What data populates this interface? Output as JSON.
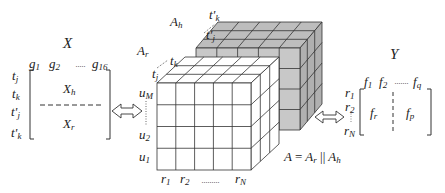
{
  "matrix_x": {
    "title": "X",
    "columns": [
      {
        "base": "g",
        "sub": "1"
      },
      {
        "base": "g",
        "sub": "2"
      },
      {
        "ellipsis": "·····"
      },
      {
        "base": "g",
        "sub": "16"
      }
    ],
    "rows": [
      {
        "base": "t",
        "sub": "j",
        "prime": false
      },
      {
        "base": "t",
        "sub": "k",
        "prime": false
      },
      {
        "base": "t'",
        "sub": "j",
        "prime": true
      },
      {
        "base": "t'",
        "sub": "k",
        "prime": true
      }
    ],
    "blocks": [
      {
        "base": "X",
        "sub": "h"
      },
      {
        "base": "X",
        "sub": "r"
      }
    ]
  },
  "tensor_a": {
    "front_block": {
      "base": "A",
      "sub": "r",
      "depth_labels": [
        {
          "base": "t",
          "sub": "j"
        },
        {
          "base": "t",
          "sub": "k"
        }
      ]
    },
    "back_block": {
      "base": "A",
      "sub": "h",
      "depth_labels": [
        {
          "base": "t'",
          "sub": "j"
        },
        {
          "base": "t'",
          "sub": "k"
        }
      ]
    },
    "row_labels": [
      {
        "base": "u",
        "sub": "M"
      },
      {
        "base": "u",
        "sub": "2"
      },
      {
        "base": "u",
        "sub": "1"
      }
    ],
    "column_labels": [
      {
        "base": "r",
        "sub": "1"
      },
      {
        "base": "r",
        "sub": "2"
      },
      {
        "ellipsis": "·········"
      },
      {
        "base": "r",
        "sub": "N"
      }
    ],
    "equation": {
      "lhs": "A",
      "eq": "=",
      "a": "A",
      "a_sub": "r",
      "op": "||",
      "b": "A",
      "b_sub": "h"
    },
    "colors": {
      "front_fill": "#ffffff",
      "back_fill": "#c8c8c8",
      "back_top": "#bdbdbd",
      "back_side": "#b0b0b0",
      "stroke": "#333333"
    }
  },
  "matrix_y": {
    "title": "Y",
    "columns": [
      {
        "base": "f",
        "sub": "1"
      },
      {
        "base": "f",
        "sub": "2"
      },
      {
        "ellipsis": "·······"
      },
      {
        "base": "f",
        "sub": "q"
      }
    ],
    "rows": [
      {
        "base": "r",
        "sub": "1"
      },
      {
        "base": "r",
        "sub": "2"
      },
      {
        "base": "r",
        "sub": "N"
      }
    ],
    "blocks": [
      {
        "base": "f",
        "sub": "r"
      },
      {
        "base": "f",
        "sub": "p"
      }
    ]
  },
  "arrows": [
    {
      "name": "x-to-a",
      "glyph": "double-headed-arrow"
    },
    {
      "name": "a-to-y",
      "glyph": "double-headed-arrow"
    }
  ]
}
